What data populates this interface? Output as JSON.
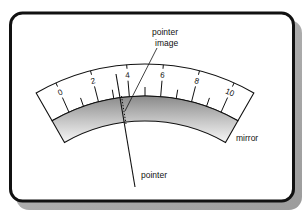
{
  "diagram": {
    "scale": {
      "min": 0,
      "max": 10,
      "major_labels": [
        "0",
        "2",
        "4",
        "6",
        "8",
        "10"
      ],
      "minor_step": 1
    },
    "labels": {
      "pointer_image_line1": "pointer",
      "pointer_image_line2": "image",
      "mirror": "mirror",
      "pointer": "pointer"
    },
    "colors": {
      "stroke": "#111111",
      "card_bg": "#ffffff",
      "shadow": "#a8a8a8",
      "mirror_dark": "#8c8c8c",
      "mirror_light": "#f4f4f4"
    },
    "pointer_reading": 3.7
  }
}
